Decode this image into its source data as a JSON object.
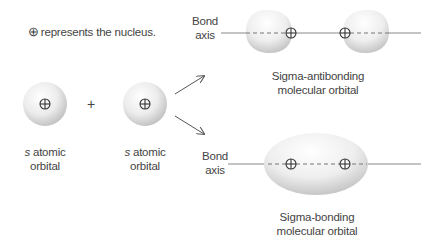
{
  "legend": {
    "symbol": "⊕",
    "text": "represents the nucleus."
  },
  "operators": {
    "plus": "+"
  },
  "atomic_orbitals": [
    {
      "prefix": "s",
      "line1_rest": " atomic",
      "line2": "orbital"
    },
    {
      "prefix": "s",
      "line1_rest": " atomic",
      "line2": "orbital"
    }
  ],
  "bond_axis_labels": [
    {
      "line1": "Bond",
      "line2": "axis"
    },
    {
      "line1": "Bond",
      "line2": "axis"
    }
  ],
  "molecular_orbitals": {
    "antibonding": {
      "line1": "Sigma-antibonding",
      "line2": "molecular orbital"
    },
    "bonding": {
      "line1": "Sigma-bonding",
      "line2": "molecular orbital"
    }
  },
  "colors": {
    "orbital_light": "#ffffff",
    "orbital_shade": "#c9c9c9",
    "line": "#7a7a7a",
    "text": "#444444"
  }
}
